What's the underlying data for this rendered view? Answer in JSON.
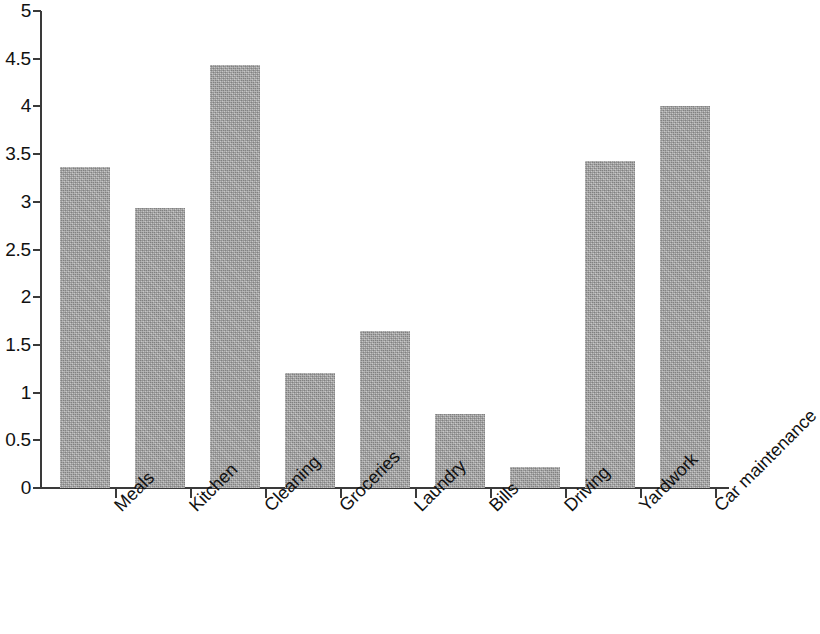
{
  "chart_data": {
    "type": "bar",
    "title": "",
    "subtitle": "",
    "xlabel": "",
    "ylabel": "",
    "categories": [
      "Meals",
      "Kitchen",
      "Cleaning",
      "Groceries",
      "Laundry",
      "Bills",
      "Driving",
      "Yardwork",
      "Car maintenance"
    ],
    "values": [
      3.36,
      2.93,
      4.43,
      1.21,
      1.65,
      0.78,
      0.22,
      3.43,
      4.0
    ],
    "ylim": [
      0,
      5
    ],
    "ytick_labels": [
      "5",
      "4.5",
      "4",
      "3.5",
      "3",
      "2.5",
      "2",
      "1.5",
      "1",
      "0.5",
      "0"
    ],
    "ytick_values": [
      5,
      4.5,
      4,
      3.5,
      3,
      2.5,
      2,
      1.5,
      1,
      0.5,
      0
    ],
    "grid": false,
    "legend": null,
    "legend_position": "none",
    "bar_color": "#a9a9a9",
    "axis_color": "#3a3a3a",
    "text_color": "#111111",
    "xtick_label_rotation": -45
  }
}
